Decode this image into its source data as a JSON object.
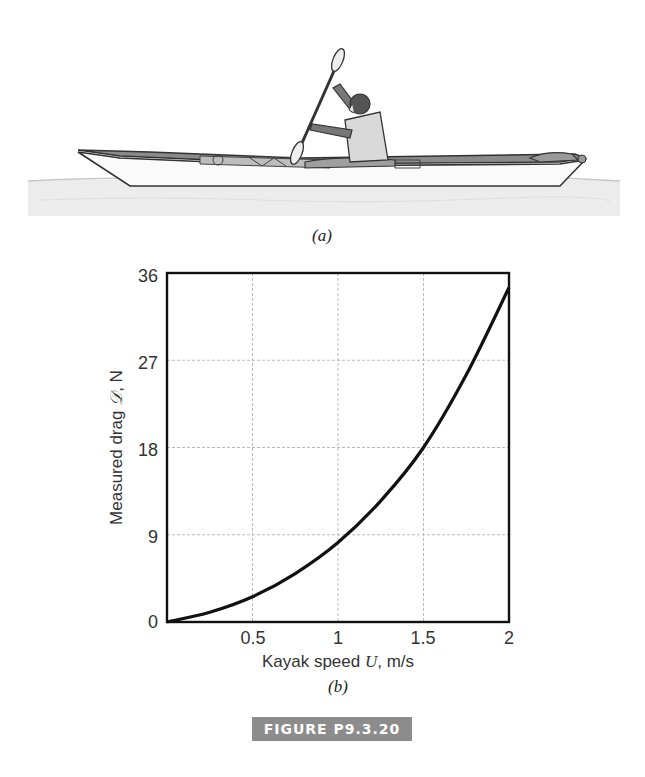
{
  "figure": {
    "caption": "FIGURE P9.3.20",
    "caption_bg": "#8c8c8c",
    "panel_a_label": "(a)",
    "panel_b_label": "(b)",
    "illustration": "kayak-with-paddler-on-water"
  },
  "chart_data": {
    "type": "line",
    "title": "",
    "xlabel": "Kayak speed U, m/s",
    "xlabel_parts": {
      "prefix": "Kayak speed ",
      "var": "U",
      "suffix": ", m/s"
    },
    "ylabel": "Measured drag 𝒟, N",
    "ylabel_parts": {
      "prefix": "Measured drag ",
      "var": "𝒟",
      "suffix": ", N"
    },
    "xlim": [
      0,
      2
    ],
    "ylim": [
      0,
      36
    ],
    "x_ticks": [
      "0.5",
      "1",
      "1.5",
      "2"
    ],
    "y_ticks": [
      "0",
      "9",
      "18",
      "27",
      "36"
    ],
    "grid": true,
    "legend": null,
    "series": [
      {
        "name": "Measured drag",
        "x": [
          0,
          0.25,
          0.5,
          0.75,
          1.0,
          1.25,
          1.5,
          1.75,
          2.0
        ],
        "y": [
          0,
          1.0,
          2.6,
          5.0,
          8.2,
          12.5,
          18.0,
          25.5,
          34.5
        ]
      }
    ]
  }
}
